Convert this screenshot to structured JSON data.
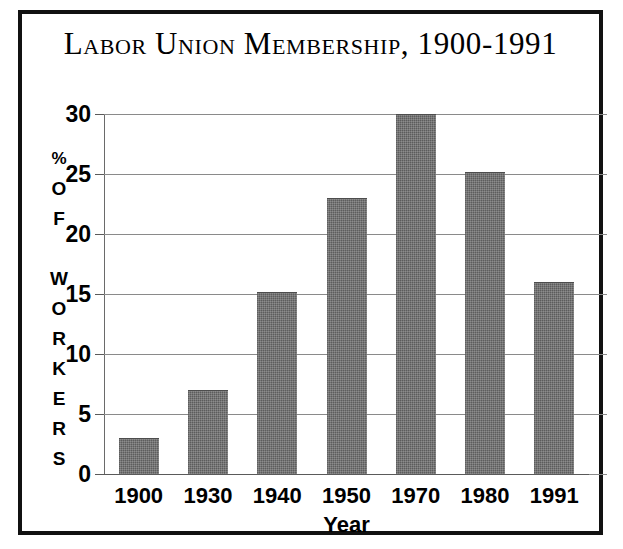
{
  "chart_data": {
    "type": "bar",
    "title": "Labor Union Membership, 1900-1991",
    "xlabel": "Year",
    "ylabel": "% OF WORKERS",
    "ylabel_chars": [
      "%",
      "O",
      "F",
      "",
      "W",
      "O",
      "R",
      "K",
      "E",
      "R",
      "S"
    ],
    "categories": [
      "1900",
      "1930",
      "1940",
      "1950",
      "1970",
      "1980",
      "1991"
    ],
    "values": [
      3,
      7,
      15.2,
      23,
      30,
      25.2,
      16
    ],
    "ylim": [
      0,
      30
    ],
    "yticks": [
      0,
      5,
      10,
      15,
      20,
      25,
      30
    ],
    "ytick_labels": [
      "0",
      "5",
      "10",
      "15",
      "20",
      "25",
      "30"
    ],
    "grid": true,
    "legend": "none",
    "bar_color": "#6a6a6a",
    "frame_color": "#111111",
    "background_color": "#ffffff"
  }
}
